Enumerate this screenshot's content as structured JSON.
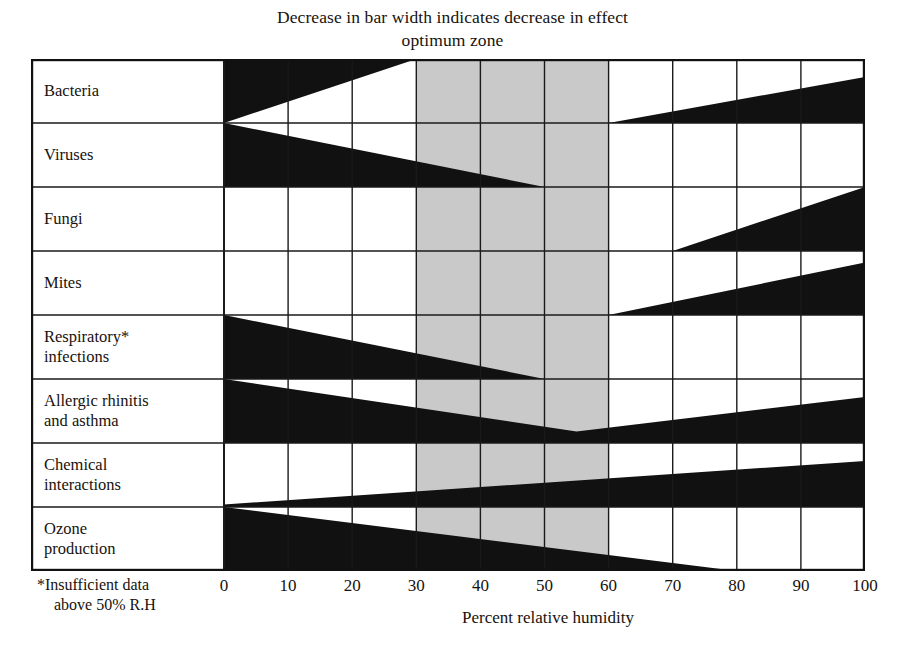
{
  "title": {
    "line1": "Decrease in bar width indicates decrease in effect",
    "line2": "optimum zone"
  },
  "axis": {
    "caption": "Percent relative humidity",
    "ticks": [
      "0",
      "10",
      "20",
      "30",
      "40",
      "50",
      "60",
      "70",
      "80",
      "90",
      "100"
    ]
  },
  "footnote": {
    "line1": "*Insufficient data",
    "line2": "above 50% R.H"
  },
  "rows": [
    {
      "label_line1": "Bacteria",
      "label_line2": ""
    },
    {
      "label_line1": "Viruses",
      "label_line2": ""
    },
    {
      "label_line1": "Fungi",
      "label_line2": ""
    },
    {
      "label_line1": "Mites",
      "label_line2": ""
    },
    {
      "label_line1": "Respiratory*",
      "label_line2": "infections"
    },
    {
      "label_line1": "Allergic rhinitis",
      "label_line2": "and asthma"
    },
    {
      "label_line1": "Chemical",
      "label_line2": "interactions"
    },
    {
      "label_line1": "Ozone",
      "label_line2": "production"
    }
  ],
  "colors": {
    "bar": "#111111",
    "optimum_zone": "#c9c9c9",
    "grid": "#1a1a1a",
    "frame": "#111111",
    "background": "#ffffff",
    "text": "#17120e"
  },
  "chart_data": {
    "type": "area",
    "title": "Decrease in bar width indicates decrease in effect optimum zone",
    "xlabel": "Percent relative humidity",
    "ylabel": "",
    "xlim": [
      0,
      100
    ],
    "xticks": [
      0,
      10,
      20,
      30,
      40,
      50,
      60,
      70,
      80,
      90,
      100
    ],
    "grid": true,
    "legend": "none",
    "annotations": [
      "Decrease in bar width indicates decrease in effect",
      "optimum zone (shaded band 30-60% relative humidity)",
      "*Insufficient data above 50% R.H"
    ],
    "optimum_zone": {
      "start": 30,
      "end": 60,
      "shaded": true
    },
    "note": "Each row is a horizontal wedge bar whose thickness encodes magnitude of effect (fraction of row height, 0-1). Wedges are anchored to either the top or bottom edge of their row band.",
    "categories": [
      "Bacteria",
      "Viruses",
      "Fungi",
      "Mites",
      "Respiratory* infections",
      "Allergic rhinitis and asthma",
      "Chemical interactions",
      "Ozone production"
    ],
    "series": [
      {
        "name": "Bacteria",
        "anchor": "mixed",
        "segments": [
          {
            "anchor": "top",
            "points": [
              {
                "x": 0,
                "thickness": 1.0
              },
              {
                "x": 30,
                "thickness": 0.0
              }
            ]
          },
          {
            "anchor": "bottom",
            "points": [
              {
                "x": 60,
                "thickness": 0.0
              },
              {
                "x": 100,
                "thickness": 0.72
              }
            ]
          }
        ]
      },
      {
        "name": "Viruses",
        "anchor": "bottom",
        "segments": [
          {
            "anchor": "bottom",
            "points": [
              {
                "x": 0,
                "thickness": 1.0
              },
              {
                "x": 50,
                "thickness": 0.0
              }
            ]
          }
        ]
      },
      {
        "name": "Fungi",
        "anchor": "bottom",
        "segments": [
          {
            "anchor": "bottom",
            "points": [
              {
                "x": 70,
                "thickness": 0.0
              },
              {
                "x": 100,
                "thickness": 1.0
              }
            ]
          }
        ]
      },
      {
        "name": "Mites",
        "anchor": "bottom",
        "segments": [
          {
            "anchor": "bottom",
            "points": [
              {
                "x": 60,
                "thickness": 0.0
              },
              {
                "x": 100,
                "thickness": 0.82
              }
            ]
          }
        ]
      },
      {
        "name": "Respiratory* infections",
        "anchor": "bottom",
        "segments": [
          {
            "anchor": "bottom",
            "points": [
              {
                "x": 0,
                "thickness": 1.0
              },
              {
                "x": 50,
                "thickness": 0.0
              }
            ]
          }
        ]
      },
      {
        "name": "Allergic rhinitis and asthma",
        "anchor": "bottom",
        "segments": [
          {
            "anchor": "bottom",
            "points": [
              {
                "x": 0,
                "thickness": 1.0
              },
              {
                "x": 55,
                "thickness": 0.18
              },
              {
                "x": 100,
                "thickness": 0.72
              }
            ]
          }
        ]
      },
      {
        "name": "Chemical interactions",
        "anchor": "bottom",
        "segments": [
          {
            "anchor": "bottom",
            "points": [
              {
                "x": 0,
                "thickness": 0.04
              },
              {
                "x": 100,
                "thickness": 0.72
              }
            ]
          }
        ]
      },
      {
        "name": "Ozone production",
        "anchor": "bottom",
        "segments": [
          {
            "anchor": "bottom",
            "points": [
              {
                "x": 0,
                "thickness": 1.0
              },
              {
                "x": 80,
                "thickness": 0.0
              }
            ]
          }
        ]
      }
    ]
  }
}
